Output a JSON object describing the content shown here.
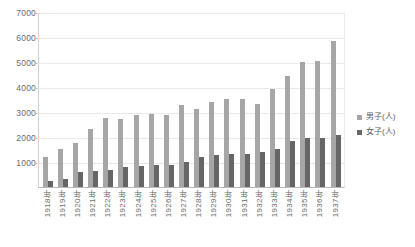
{
  "chart_data": {
    "type": "bar",
    "title": "",
    "subtitle": "",
    "xlabel": "",
    "ylabel": "",
    "ylim": [
      0,
      7000
    ],
    "ytick_values": [
      7000,
      6000,
      5000,
      4000,
      3000,
      2000,
      1000,
      0
    ],
    "ytick_labels": [
      "7000",
      "6000",
      "5000",
      "4000",
      "3000",
      "2000",
      "1000",
      ""
    ],
    "grid": true,
    "legend_position": "right",
    "categories": [
      "1918年",
      "1919年",
      "1920年",
      "1921年",
      "1922年",
      "1923年",
      "1924年",
      "1925年",
      "1926年",
      "1927年",
      "1928年",
      "1929年",
      "1930年",
      "1931年",
      "1932年",
      "1933年",
      "1934年",
      "1935年",
      "1936年",
      "1937年"
    ],
    "series": [
      {
        "name": "男子(人)",
        "color": "#a6a6a6",
        "values": [
          1200,
          1550,
          1800,
          2350,
          2800,
          2750,
          2900,
          2950,
          2900,
          3300,
          3150,
          3450,
          3550,
          3550,
          3350,
          3950,
          4500,
          5050,
          5100,
          5900
        ]
      },
      {
        "name": "女子(人)",
        "color": "#666666",
        "values": [
          250,
          330,
          600,
          650,
          700,
          800,
          850,
          900,
          900,
          1000,
          1200,
          1300,
          1350,
          1350,
          1400,
          1550,
          1850,
          2000,
          2000,
          2100
        ]
      }
    ]
  },
  "legend": {
    "items": [
      {
        "label": "男子(人)",
        "color": "#a6a6a6"
      },
      {
        "label": "女子(人)",
        "color": "#666666"
      }
    ]
  }
}
